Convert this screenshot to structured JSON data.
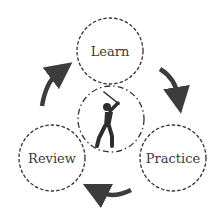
{
  "diagram": {
    "type": "cycle",
    "center": {
      "icon": "golfer-icon",
      "border": "dash-dot"
    },
    "nodes": [
      {
        "id": "learn",
        "label": "Learn"
      },
      {
        "id": "practice",
        "label": "Practice"
      },
      {
        "id": "review",
        "label": "Review"
      }
    ],
    "edges": [
      {
        "from": "learn",
        "to": "practice",
        "direction": "clockwise"
      },
      {
        "from": "practice",
        "to": "review",
        "direction": "clockwise"
      },
      {
        "from": "review",
        "to": "learn",
        "direction": "clockwise"
      }
    ],
    "colors": {
      "stroke": "#333333",
      "arrow": "#3c3c3c",
      "text": "#3a3a3a",
      "background": "#ffffff"
    }
  }
}
